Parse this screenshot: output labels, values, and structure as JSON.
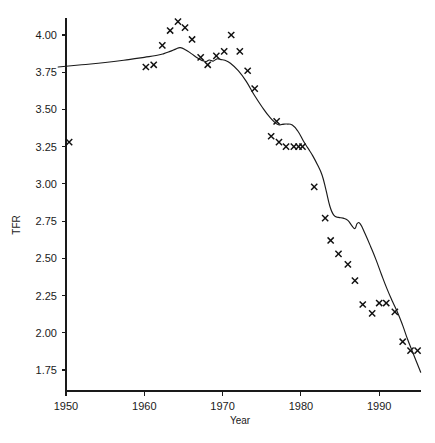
{
  "chart_data": {
    "type": "scatter",
    "title": "",
    "xlabel": "Year",
    "ylabel": "TFR",
    "xlim": [
      1948.5,
      1995.5
    ],
    "ylim": [
      1.62,
      4.13
    ],
    "grid": false,
    "legend": "none",
    "xticks": [
      1950,
      1960,
      1970,
      1980,
      1990
    ],
    "xtick_labels": [
      "1950",
      "1960",
      "1970",
      "1980",
      "1990"
    ],
    "yticks": [
      1.75,
      2.0,
      2.25,
      2.5,
      2.75,
      3.0,
      3.25,
      3.5,
      3.75,
      4.0
    ],
    "ytick_labels": [
      "1.75",
      "2.00",
      "2.25",
      "2.50",
      "2.75",
      "3.00",
      "3.25",
      "3.50",
      "3.75",
      "4.00"
    ],
    "series": [
      {
        "name": "Observed TFR",
        "marker": "x",
        "x": [
          1950.4,
          1960.2,
          1961.2,
          1962.3,
          1963.3,
          1964.3,
          1965.2,
          1966.1,
          1967.2,
          1968.1,
          1969.2,
          1970.2,
          1971.1,
          1972.2,
          1973.2,
          1974.1,
          1976.2,
          1976.9,
          1977.2,
          1978.1,
          1979.1,
          1979.7,
          1980.2,
          1981.7,
          1983.1,
          1983.8,
          1984.8,
          1986.0,
          1986.9,
          1987.9,
          1989.1,
          1990.0,
          1990.9,
          1992.0,
          1993.0,
          1994.0,
          1994.9
        ],
        "y": [
          3.28,
          3.785,
          3.8,
          3.93,
          4.03,
          4.09,
          4.05,
          3.97,
          3.85,
          3.8,
          3.86,
          3.89,
          4.0,
          3.89,
          3.76,
          3.64,
          3.32,
          3.42,
          3.28,
          3.25,
          3.25,
          3.25,
          3.25,
          2.98,
          2.77,
          2.62,
          2.53,
          2.46,
          2.35,
          2.19,
          2.13,
          2.2,
          2.2,
          2.14,
          1.94,
          1.88,
          1.88
        ]
      },
      {
        "name": "Fitted trend",
        "marker": "line",
        "x": [
          1949.0,
          1952.0,
          1955.0,
          1958.0,
          1960.0,
          1961.5,
          1962.5,
          1963.3,
          1964.0,
          1964.6,
          1965.3,
          1966.0,
          1966.8,
          1967.4,
          1967.9,
          1968.3,
          1968.8,
          1969.3,
          1969.8,
          1970.3,
          1971.0,
          1972.0,
          1973.0,
          1974.0,
          1975.0,
          1976.0,
          1977.0,
          1977.6,
          1978.2,
          1978.9,
          1979.6,
          1980.3,
          1980.9,
          1981.5,
          1982.1,
          1982.7,
          1983.2,
          1983.7,
          1984.2,
          1984.8,
          1985.4,
          1986.0,
          1986.5,
          1986.9,
          1987.2,
          1987.6,
          1988.2,
          1988.9,
          1989.6,
          1990.3,
          1991.0,
          1991.7,
          1992.4,
          1993.0,
          1993.6,
          1994.2,
          1994.8,
          1995.3
        ],
        "y": [
          3.785,
          3.8,
          3.815,
          3.835,
          3.85,
          3.862,
          3.875,
          3.89,
          3.905,
          3.915,
          3.9,
          3.875,
          3.845,
          3.828,
          3.822,
          3.832,
          3.825,
          3.84,
          3.835,
          3.83,
          3.81,
          3.76,
          3.69,
          3.6,
          3.52,
          3.45,
          3.4,
          3.4,
          3.402,
          3.395,
          3.355,
          3.29,
          3.24,
          3.19,
          3.13,
          3.06,
          2.96,
          2.85,
          2.79,
          2.775,
          2.77,
          2.755,
          2.72,
          2.7,
          2.735,
          2.73,
          2.665,
          2.58,
          2.49,
          2.39,
          2.295,
          2.21,
          2.13,
          2.05,
          1.96,
          1.88,
          1.8,
          1.735
        ]
      }
    ]
  }
}
